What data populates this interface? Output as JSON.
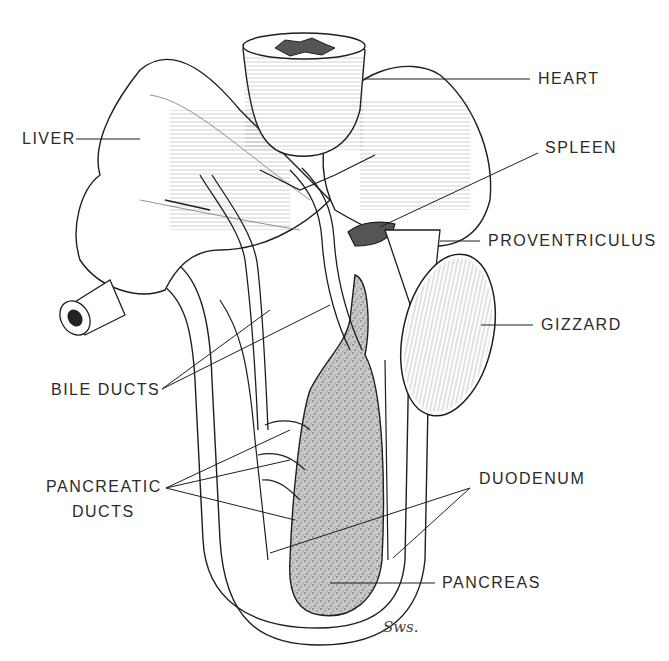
{
  "figure": {
    "colors": {
      "ink": "#1e1e1e",
      "paper": "#ffffff",
      "stipple": "#8a8a8a"
    },
    "labels": {
      "heart": "HEART",
      "liver": "LIVER",
      "spleen": "SPLEEN",
      "proventriculus": "PROVENTRICULUS",
      "gizzard": "GIZZARD",
      "bile_ducts": "BILE DUCTS",
      "duodenum": "DUODENUM",
      "pancreatic_ducts_line1": "PANCREATIC",
      "pancreatic_ducts_line2": "DUCTS",
      "pancreas": "PANCREAS"
    },
    "signature": "Sws."
  }
}
